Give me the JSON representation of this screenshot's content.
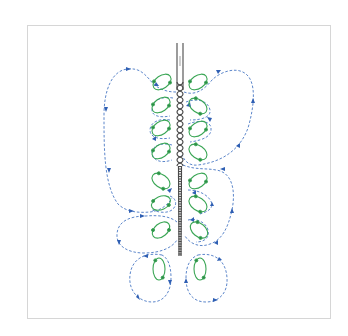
{
  "figure": {
    "colors": {
      "vortex": "#3aa655",
      "vortex_arrow": "#2e8b48",
      "flow": "#4a78c4",
      "flow_arrow": "#2f5fb3",
      "rod": "#4a4a4a",
      "frame": "#d6d6d6",
      "background": "#ffffff"
    },
    "rod": {
      "top_y": 43,
      "bottom_y": 256,
      "x_left": 177,
      "x_right": 183,
      "helix_start_y": 80,
      "helix_end_y": 165
    },
    "left_vortices": [
      {
        "cx": 162,
        "cy": 82,
        "rx": 10,
        "ry": 6.5,
        "angle": -35
      },
      {
        "cx": 161,
        "cy": 105,
        "rx": 10,
        "ry": 6.5,
        "angle": -35
      },
      {
        "cx": 161,
        "cy": 128,
        "rx": 10,
        "ry": 6.5,
        "angle": -35
      },
      {
        "cx": 161,
        "cy": 151,
        "rx": 10,
        "ry": 6.5,
        "angle": -35
      },
      {
        "cx": 161,
        "cy": 181,
        "rx": 10,
        "ry": 6.5,
        "angle": 35
      },
      {
        "cx": 161,
        "cy": 203,
        "rx": 10,
        "ry": 6.5,
        "angle": -25
      },
      {
        "cx": 161,
        "cy": 230,
        "rx": 10,
        "ry": 6.5,
        "angle": -40
      }
    ],
    "right_vortices": [
      {
        "cx": 198,
        "cy": 82,
        "rx": 10,
        "ry": 6.5,
        "angle": -35
      },
      {
        "cx": 198,
        "cy": 106,
        "rx": 10,
        "ry": 6.5,
        "angle": 35
      },
      {
        "cx": 198,
        "cy": 129,
        "rx": 10,
        "ry": 6.5,
        "angle": -35
      },
      {
        "cx": 198,
        "cy": 152,
        "rx": 10,
        "ry": 6.5,
        "angle": 35
      },
      {
        "cx": 198,
        "cy": 181,
        "rx": 10,
        "ry": 6.5,
        "angle": -35
      },
      {
        "cx": 198,
        "cy": 204,
        "rx": 10,
        "ry": 6.5,
        "angle": 35
      },
      {
        "cx": 199,
        "cy": 230,
        "rx": 10,
        "ry": 6.5,
        "angle": 40
      }
    ],
    "bottom_vortices": [
      {
        "cx": 159,
        "cy": 269,
        "rx": 6,
        "ry": 11,
        "angle": 0
      },
      {
        "cx": 200,
        "cy": 269,
        "rx": 6,
        "ry": 11,
        "angle": 0
      }
    ]
  }
}
